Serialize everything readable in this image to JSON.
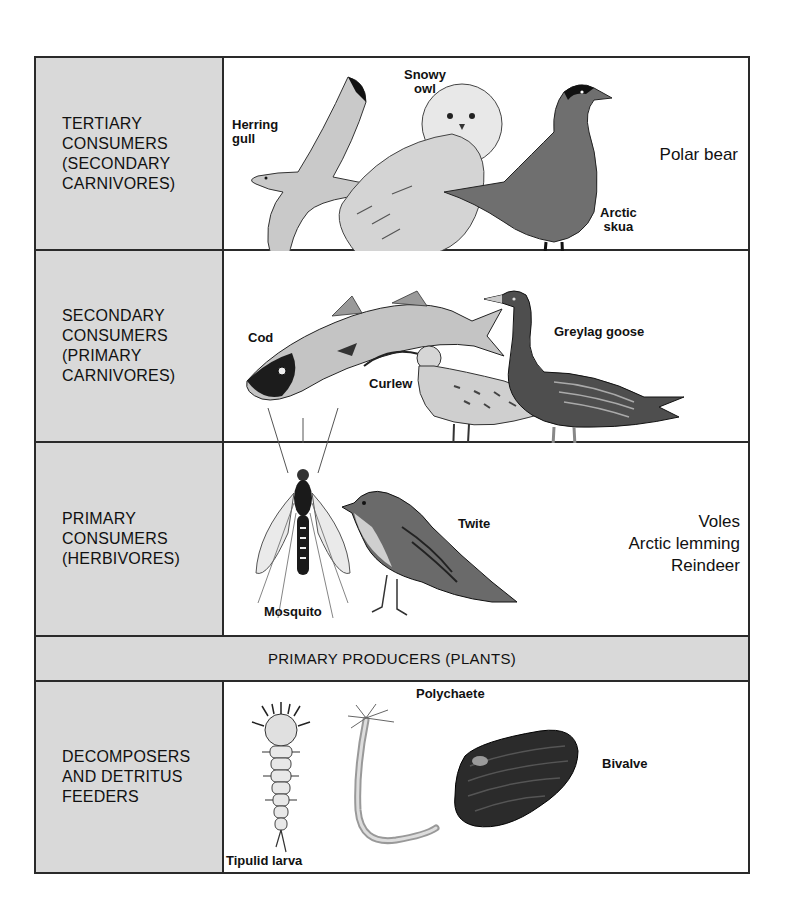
{
  "diagram": {
    "type": "food-web-trophic-levels",
    "rows": [
      {
        "id": "tertiary",
        "label": "TERTIARY\nCONSUMERS\n(SECONDARY\nCARNIVORES)",
        "organisms": [
          {
            "name": "Herring\ngull",
            "icon": "herring-gull-illustration"
          },
          {
            "name": "Snowy\nowl",
            "icon": "snowy-owl-illustration"
          },
          {
            "name": "Arctic\nskua",
            "icon": "arctic-skua-illustration"
          }
        ],
        "text_only": "Polar bear"
      },
      {
        "id": "secondary",
        "label": "SECONDARY\nCONSUMERS\n(PRIMARY\nCARNIVORES)",
        "organisms": [
          {
            "name": "Cod",
            "icon": "cod-illustration"
          },
          {
            "name": "Curlew",
            "icon": "curlew-illustration"
          },
          {
            "name": "Greylag  goose",
            "icon": "greylag-goose-illustration"
          }
        ]
      },
      {
        "id": "primary",
        "label": "PRIMARY\nCONSUMERS\n(HERBIVORES)",
        "organisms": [
          {
            "name": "Mosquito",
            "icon": "mosquito-illustration"
          },
          {
            "name": "Twite",
            "icon": "twite-illustration"
          }
        ],
        "text_only": "Voles\nArctic  lemming\nReindeer"
      },
      {
        "id": "producers",
        "label": "PRIMARY PRODUCERS (PLANTS)"
      },
      {
        "id": "decomposers",
        "label": "DECOMPOSERS\nAND DETRITUS\nFEEDERS",
        "organisms": [
          {
            "name": "Tipulid  larva",
            "icon": "tipulid-larva-illustration"
          },
          {
            "name": "Polychaete",
            "icon": "polychaete-illustration"
          },
          {
            "name": "Bivalve",
            "icon": "bivalve-illustration"
          }
        ]
      }
    ]
  },
  "colors": {
    "label_cell": "#d9d9d9",
    "border": "#2a2a2a",
    "background": "#ffffff"
  }
}
